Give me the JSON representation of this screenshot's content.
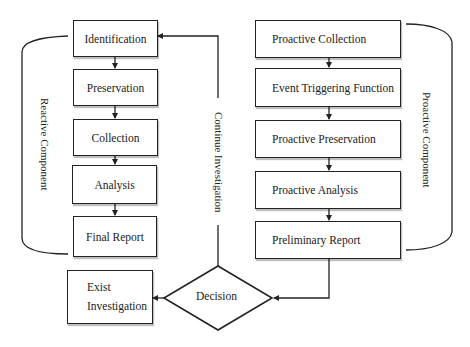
{
  "diagram": {
    "reactive_component": {
      "label": "Reactive Component",
      "steps": [
        {
          "label": "Identification"
        },
        {
          "label": "Preservation"
        },
        {
          "label": "Collection"
        },
        {
          "label": "Analysis"
        },
        {
          "label": "Final Report"
        }
      ]
    },
    "proactive_component": {
      "label": "Proactive Component",
      "steps": [
        {
          "label": "Proactive Collection"
        },
        {
          "label": "Event Triggering Function"
        },
        {
          "label": "Proactive Preservation"
        },
        {
          "label": "Proactive Analysis"
        },
        {
          "label": "Preliminary Report"
        }
      ]
    },
    "decision": {
      "label": "Decision"
    },
    "exit_box": {
      "line1": "Exist",
      "line2": "Investigation"
    },
    "loop_label": "Continue Investigation",
    "edges": [
      {
        "from": "Identification",
        "to": "Preservation"
      },
      {
        "from": "Preservation",
        "to": "Collection"
      },
      {
        "from": "Collection",
        "to": "Analysis"
      },
      {
        "from": "Analysis",
        "to": "Final Report"
      },
      {
        "from": "Proactive Collection",
        "to": "Event Triggering Function"
      },
      {
        "from": "Event Triggering Function",
        "to": "Proactive Preservation"
      },
      {
        "from": "Proactive Preservation",
        "to": "Proactive Analysis"
      },
      {
        "from": "Proactive Analysis",
        "to": "Preliminary Report"
      },
      {
        "from": "Preliminary Report",
        "to": "Decision"
      },
      {
        "from": "Decision",
        "to": "Exist Investigation"
      },
      {
        "from": "Decision",
        "to": "Identification",
        "label": "Continue Investigation"
      }
    ],
    "colors": {
      "line": "#222222",
      "background": "#ffffff"
    }
  }
}
